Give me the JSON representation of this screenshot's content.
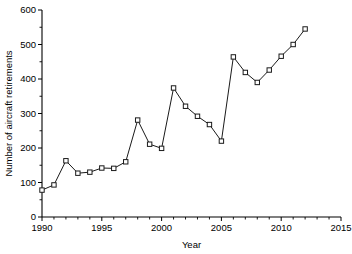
{
  "chart_data": {
    "type": "line",
    "title": "",
    "xlabel": "Year",
    "ylabel": "Number of aircraft retirements",
    "xlim": [
      1990,
      2015
    ],
    "ylim": [
      0,
      600
    ],
    "grid": false,
    "legend": null,
    "marker": "open-square",
    "line_color": "#1a1a1a",
    "marker_face_color": "#ffffff",
    "x_major_ticks": [
      1990,
      1995,
      2000,
      2005,
      2010,
      2015
    ],
    "x_major_tick_labels": [
      "1990",
      "1995",
      "2000",
      "2005",
      "2010",
      "2015"
    ],
    "x_minor_tick_interval": 1,
    "y_major_ticks": [
      0,
      100,
      200,
      300,
      400,
      500,
      600
    ],
    "y_major_tick_labels": [
      "0",
      "100",
      "200",
      "300",
      "400",
      "500",
      "600"
    ],
    "y_minor_tick_interval": 50,
    "x": [
      1990,
      1991,
      1992,
      1993,
      1994,
      1995,
      1996,
      1997,
      1998,
      1999,
      2000,
      2001,
      2002,
      2003,
      2004,
      2005,
      2006,
      2007,
      2008,
      2009,
      2010,
      2011,
      2012
    ],
    "values": [
      78,
      93,
      163,
      127,
      130,
      142,
      141,
      160,
      281,
      211,
      199,
      374,
      321,
      292,
      268,
      220,
      464,
      419,
      390,
      426,
      466,
      500,
      545
    ],
    "points": [
      {
        "year": 1990,
        "value": 78
      },
      {
        "year": 1991,
        "value": 93
      },
      {
        "year": 1992,
        "value": 163
      },
      {
        "year": 1993,
        "value": 127
      },
      {
        "year": 1994,
        "value": 130
      },
      {
        "year": 1995,
        "value": 142
      },
      {
        "year": 1996,
        "value": 141
      },
      {
        "year": 1997,
        "value": 160
      },
      {
        "year": 1998,
        "value": 281
      },
      {
        "year": 1999,
        "value": 211
      },
      {
        "year": 2000,
        "value": 199
      },
      {
        "year": 2001,
        "value": 374
      },
      {
        "year": 2002,
        "value": 321
      },
      {
        "year": 2003,
        "value": 292
      },
      {
        "year": 2004,
        "value": 268
      },
      {
        "year": 2005,
        "value": 220
      },
      {
        "year": 2006,
        "value": 464
      },
      {
        "year": 2007,
        "value": 419
      },
      {
        "year": 2008,
        "value": 390
      },
      {
        "year": 2009,
        "value": 426
      },
      {
        "year": 2010,
        "value": 466
      },
      {
        "year": 2011,
        "value": 500
      },
      {
        "year": 2012,
        "value": 545
      }
    ]
  }
}
